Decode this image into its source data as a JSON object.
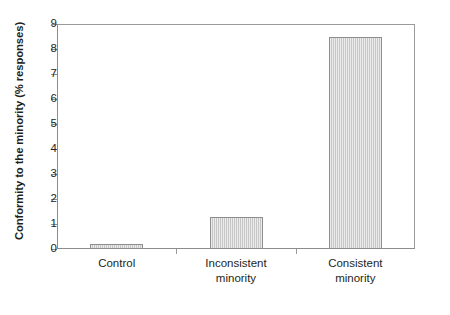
{
  "chart_data": {
    "type": "bar",
    "title": "",
    "xlabel": "",
    "ylabel": "Conformity to the minority (% responses)",
    "categories": [
      "Control",
      "Inconsistent minority",
      "Consistent minority"
    ],
    "category_lines": [
      [
        "Control"
      ],
      [
        "Inconsistent",
        "minority"
      ],
      [
        "Consistent",
        "minority"
      ]
    ],
    "values": [
      0.2,
      1.3,
      8.5
    ],
    "ylim": [
      0,
      9
    ],
    "yticks": [
      0,
      1,
      2,
      3,
      4,
      5,
      6,
      7,
      8,
      9
    ],
    "ytick_labels": [
      "0",
      "1",
      "2",
      "3",
      "4",
      "5",
      "6",
      "7",
      "8",
      "9"
    ],
    "grid": false,
    "legend": null,
    "bar_fill_color": "#d4d4d4",
    "bar_border_color": "#8e8e8e",
    "axis_color": "#8c8c8c",
    "text_color": "#231f20"
  }
}
